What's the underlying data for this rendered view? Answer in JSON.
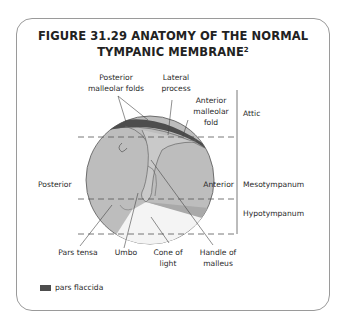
{
  "figure": {
    "title_line1": "FIGURE 31.29 ANATOMY OF THE NORMAL",
    "title_line2": "TYMPANIC MEMBRANE",
    "title_superscript": "2"
  },
  "labels": {
    "posterior_malleolar_folds": [
      "Posterior",
      "malleolar folds"
    ],
    "lateral_process": [
      "Lateral",
      "process"
    ],
    "anterior_malleolar_fold": [
      "Anterior",
      "malleolar",
      "fold"
    ],
    "posterior": "Posterior",
    "anterior": "Anterior",
    "pars_tensa": "Pars tensa",
    "umbo": "Umbo",
    "cone_of_light": [
      "Cone of",
      "light"
    ],
    "handle_of_malleus": [
      "Handle of",
      "malleus"
    ]
  },
  "regions": {
    "attic": "Attic",
    "mesotympanum": "Mesotympanum",
    "hypotympanum": "Hypotympanum"
  },
  "legend": {
    "pars_flaccida": "pars flaccida"
  },
  "colors": {
    "pars_tensa": "#bdbdbd",
    "pars_flaccida": "#4d4d4d",
    "cone_of_light": "#f4f4f4",
    "outline": "#555555"
  }
}
